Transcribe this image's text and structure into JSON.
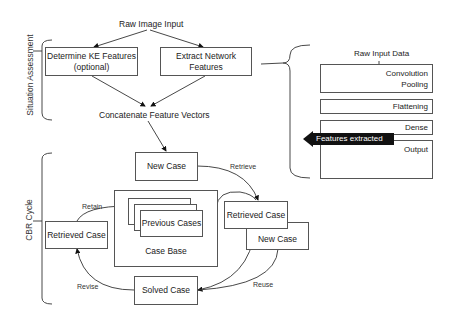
{
  "diagram": {
    "top": {
      "raw_input": "Raw Image Input",
      "ke_box": {
        "line1": "Determine KE Features",
        "line2": "(optional)"
      },
      "net_box": {
        "line1": "Extract Network",
        "line2": "Features"
      },
      "concat": "Concatenate Feature Vectors"
    },
    "side_labels": {
      "situation": "Situation Assessment",
      "cbr": "CBR Cycle"
    },
    "cnn": {
      "raw_input": "Raw Input Data",
      "layers": [
        {
          "line1": "Convolution",
          "line2": "Pooling"
        },
        {
          "line1": "Flattening"
        },
        {
          "line1": "Dense"
        },
        {
          "line1": "Output"
        }
      ],
      "features_label": "Features extracted"
    },
    "cbr": {
      "new_case": "New Case",
      "retrieve": "Retrieve",
      "previous_cases": "Previous Cases",
      "case_base": "Case Base",
      "retain": "Retain",
      "retrieved_left": "Retrieved Case",
      "retrieved_right": "Retrieved Case",
      "new_case_right": "New Case",
      "solved_case": "Solved Case",
      "revise": "Revise",
      "reuse": "Reuse"
    }
  }
}
